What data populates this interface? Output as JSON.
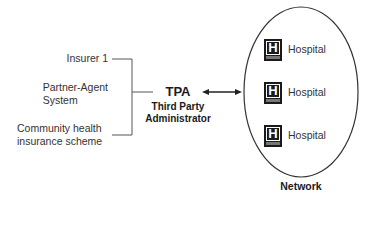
{
  "sources": [
    {
      "label_lines": [
        "Insurer 1"
      ]
    },
    {
      "label_lines": [
        "Partner-Agent",
        "System"
      ]
    },
    {
      "label_lines": [
        "Community health",
        "insurance scheme"
      ]
    }
  ],
  "tpa": {
    "title": "TPA",
    "subtitle_line1": "Third Party",
    "subtitle_line2": "Administrator"
  },
  "network": {
    "label": "Network",
    "hospitals": [
      {
        "icon": "hospital-h-icon",
        "icon_letter": "H",
        "label": "Hospital"
      },
      {
        "icon": "hospital-h-icon",
        "icon_letter": "H",
        "label": "Hospital"
      },
      {
        "icon": "hospital-h-icon",
        "icon_letter": "H",
        "label": "Hospital"
      }
    ]
  },
  "colors": {
    "line": "#555555",
    "text": "#333333",
    "icon": "#1a1a1a"
  }
}
